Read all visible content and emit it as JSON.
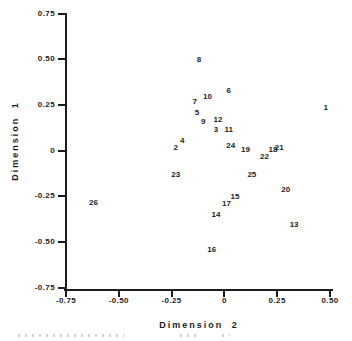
{
  "figure": {
    "background": "#ffffff",
    "ink_color": "#1c1c1c"
  },
  "chart_data": {
    "type": "scatter",
    "title": "",
    "xlabel": "Dimension 2",
    "ylabel": "Dimension 1",
    "xlim": [
      -0.75,
      0.5
    ],
    "ylim": [
      -0.75,
      0.75
    ],
    "grid": false,
    "legend": "none",
    "marker_style": "numeric-point-labels",
    "xticks": [
      {
        "value": -0.75,
        "label": "-0.75"
      },
      {
        "value": -0.5,
        "label": "-0.50"
      },
      {
        "value": -0.25,
        "label": "-0.25"
      },
      {
        "value": 0,
        "label": "0"
      },
      {
        "value": 0.25,
        "label": "0.25"
      },
      {
        "value": 0.5,
        "label": "0.50"
      }
    ],
    "yticks": [
      {
        "value": 0.75,
        "label": "0.75"
      },
      {
        "value": 0.5,
        "label": "0.50"
      },
      {
        "value": 0.25,
        "label": "0.25"
      },
      {
        "value": 0,
        "label": "0"
      },
      {
        "value": -0.25,
        "label": "-0.25"
      },
      {
        "value": -0.5,
        "label": "-0.50"
      },
      {
        "value": -0.75,
        "label": "-0.75"
      }
    ],
    "points": [
      {
        "label": "1",
        "x": 0.48,
        "y": 0.24
      },
      {
        "label": "2",
        "x": -0.23,
        "y": 0.02
      },
      {
        "label": "3",
        "x": -0.04,
        "y": 0.12
      },
      {
        "label": "4",
        "x": -0.2,
        "y": 0.06
      },
      {
        "label": "5",
        "x": -0.13,
        "y": 0.21
      },
      {
        "label": "6",
        "x": 0.02,
        "y": 0.33
      },
      {
        "label": "7",
        "x": -0.14,
        "y": 0.27
      },
      {
        "label": "8",
        "x": -0.12,
        "y": 0.5
      },
      {
        "label": "9",
        "x": -0.1,
        "y": 0.16
      },
      {
        "label": "10",
        "x": -0.08,
        "y": 0.3
      },
      {
        "label": "11",
        "x": 0.02,
        "y": 0.12
      },
      {
        "label": "12",
        "x": -0.03,
        "y": 0.17
      },
      {
        "label": "13",
        "x": 0.33,
        "y": -0.4
      },
      {
        "label": "14",
        "x": -0.04,
        "y": -0.35
      },
      {
        "label": "15",
        "x": 0.05,
        "y": -0.25
      },
      {
        "label": "16",
        "x": -0.06,
        "y": -0.54
      },
      {
        "label": "17",
        "x": 0.01,
        "y": -0.29
      },
      {
        "label": "18",
        "x": 0.23,
        "y": 0.01
      },
      {
        "label": "19",
        "x": 0.1,
        "y": 0.01
      },
      {
        "label": "20",
        "x": 0.29,
        "y": -0.21
      },
      {
        "label": "21",
        "x": 0.26,
        "y": 0.02
      },
      {
        "label": "22",
        "x": 0.19,
        "y": -0.03
      },
      {
        "label": "23",
        "x": -0.23,
        "y": -0.13
      },
      {
        "label": "24",
        "x": 0.03,
        "y": 0.03
      },
      {
        "label": "25",
        "x": 0.13,
        "y": -0.13
      },
      {
        "label": "26",
        "x": -0.62,
        "y": -0.28
      }
    ]
  }
}
